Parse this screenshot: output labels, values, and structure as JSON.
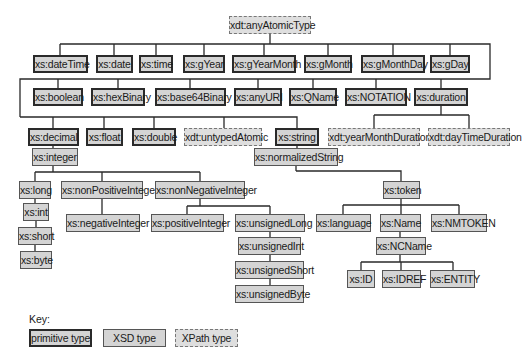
{
  "diagram": {
    "root": "xdt:anyAtomicType",
    "nodes": [
      {
        "id": "anyAtomicType",
        "label": "xdt:anyAtomicType",
        "kind": "xpath",
        "x": 229,
        "y": 16,
        "w": 82
      },
      {
        "id": "dateTime",
        "label": "xs:dateTime",
        "kind": "primitive",
        "x": 33,
        "y": 55,
        "w": 55
      },
      {
        "id": "date",
        "label": "xs:date",
        "kind": "primitive",
        "x": 96,
        "y": 55,
        "w": 37
      },
      {
        "id": "time",
        "label": "xs:time",
        "kind": "primitive",
        "x": 139,
        "y": 55,
        "w": 34
      },
      {
        "id": "gYear",
        "label": "xs:gYear",
        "kind": "primitive",
        "x": 183,
        "y": 55,
        "w": 42
      },
      {
        "id": "gYearMonth",
        "label": "xs:gYearMonth",
        "kind": "primitive",
        "x": 232,
        "y": 55,
        "w": 64
      },
      {
        "id": "gMonth",
        "label": "xs:gMonth",
        "kind": "primitive",
        "x": 304,
        "y": 55,
        "w": 48
      },
      {
        "id": "gMonthDay",
        "label": "xs:gMonthDay",
        "kind": "primitive",
        "x": 361,
        "y": 55,
        "w": 64
      },
      {
        "id": "gDay",
        "label": "xs:gDay",
        "kind": "primitive",
        "x": 430,
        "y": 55,
        "w": 40
      },
      {
        "id": "boolean",
        "label": "xs:boolean",
        "kind": "primitive",
        "x": 33,
        "y": 88,
        "w": 50
      },
      {
        "id": "hexBinary",
        "label": "xs:hexBinary",
        "kind": "primitive",
        "x": 91,
        "y": 88,
        "w": 54
      },
      {
        "id": "base64Binary",
        "label": "xs:base64Binary",
        "kind": "primitive",
        "x": 155,
        "y": 88,
        "w": 71
      },
      {
        "id": "anyURI",
        "label": "xs:anyURI",
        "kind": "primitive",
        "x": 234,
        "y": 88,
        "w": 48
      },
      {
        "id": "QName",
        "label": "xs:QName",
        "kind": "primitive",
        "x": 289,
        "y": 88,
        "w": 48
      },
      {
        "id": "NOTATION",
        "label": "xs:NOTATION",
        "kind": "primitive",
        "x": 345,
        "y": 88,
        "w": 62
      },
      {
        "id": "duration",
        "label": "xs:duration",
        "kind": "primitive",
        "x": 414,
        "y": 88,
        "w": 54
      },
      {
        "id": "decimal",
        "label": "xs:decimal",
        "kind": "primitive",
        "x": 28,
        "y": 128,
        "w": 51
      },
      {
        "id": "float",
        "label": "xs:float",
        "kind": "primitive",
        "x": 86,
        "y": 128,
        "w": 37
      },
      {
        "id": "double",
        "label": "xs:double",
        "kind": "primitive",
        "x": 132,
        "y": 128,
        "w": 44
      },
      {
        "id": "untypedAtomic",
        "label": "xdt:untypedAtomic",
        "kind": "xpath",
        "x": 184,
        "y": 128,
        "w": 78
      },
      {
        "id": "string",
        "label": "xs:string",
        "kind": "primitive",
        "x": 275,
        "y": 128,
        "w": 44
      },
      {
        "id": "yearMonthDuration",
        "label": "xdt:yearMonthDuration",
        "kind": "xpath",
        "x": 328,
        "y": 128,
        "w": 92
      },
      {
        "id": "dayTimeDuration",
        "label": "xdt:dayTimeDuration",
        "kind": "xpath",
        "x": 428,
        "y": 128,
        "w": 82
      },
      {
        "id": "integer",
        "label": "xs:integer",
        "kind": "xsd",
        "x": 32,
        "y": 148,
        "w": 46
      },
      {
        "id": "normalizedString",
        "label": "xs:normalizedString",
        "kind": "xsd",
        "x": 254,
        "y": 148,
        "w": 84
      },
      {
        "id": "long",
        "label": "xs:long",
        "kind": "xsd",
        "x": 19,
        "y": 181,
        "w": 32
      },
      {
        "id": "nonPositiveInteger",
        "label": "xs:nonPositiveInteger",
        "kind": "xsd",
        "x": 61,
        "y": 181,
        "w": 82
      },
      {
        "id": "nonNegativeInteger",
        "label": "xs:nonNegativeInteger",
        "kind": "xsd",
        "x": 155,
        "y": 181,
        "w": 90
      },
      {
        "id": "token",
        "label": "xs:token",
        "kind": "xsd",
        "x": 383,
        "y": 181,
        "w": 37
      },
      {
        "id": "int",
        "label": "xs:int",
        "kind": "xsd",
        "x": 23,
        "y": 203,
        "w": 26
      },
      {
        "id": "negativeInteger",
        "label": "xs:negativeInteger",
        "kind": "xsd",
        "x": 66,
        "y": 214,
        "w": 74
      },
      {
        "id": "positiveInteger",
        "label": "xs:positiveInteger",
        "kind": "xsd",
        "x": 151,
        "y": 214,
        "w": 73
      },
      {
        "id": "unsignedLong",
        "label": "xs:unsignedLong",
        "kind": "xsd",
        "x": 235,
        "y": 214,
        "w": 70
      },
      {
        "id": "language",
        "label": "xs:language",
        "kind": "xsd",
        "x": 316,
        "y": 214,
        "w": 55
      },
      {
        "id": "Name",
        "label": "xs:Name",
        "kind": "xsd",
        "x": 380,
        "y": 214,
        "w": 41
      },
      {
        "id": "NMTOKEN",
        "label": "xs:NMTOKEN",
        "kind": "xsd",
        "x": 431,
        "y": 214,
        "w": 56
      },
      {
        "id": "short",
        "label": "xs:short",
        "kind": "xsd",
        "x": 18,
        "y": 227,
        "w": 34
      },
      {
        "id": "unsignedInt",
        "label": "xs:unsignedInt",
        "kind": "xsd",
        "x": 238,
        "y": 237,
        "w": 63
      },
      {
        "id": "NCName",
        "label": "xs:NCName",
        "kind": "xsd",
        "x": 376,
        "y": 237,
        "w": 50
      },
      {
        "id": "byte",
        "label": "xs:byte",
        "kind": "xsd",
        "x": 20,
        "y": 251,
        "w": 32
      },
      {
        "id": "unsignedShort",
        "label": "xs:unsignedShort",
        "kind": "xsd",
        "x": 235,
        "y": 261,
        "w": 69
      },
      {
        "id": "ID",
        "label": "xs:ID",
        "kind": "xsd",
        "x": 347,
        "y": 270,
        "w": 28
      },
      {
        "id": "IDREF",
        "label": "xs:IDREF",
        "kind": "xsd",
        "x": 382,
        "y": 270,
        "w": 39
      },
      {
        "id": "ENTITY",
        "label": "xs:ENTITY",
        "kind": "xsd",
        "x": 430,
        "y": 270,
        "w": 45
      },
      {
        "id": "unsignedByte",
        "label": "xs:unsignedByte",
        "kind": "xsd",
        "x": 235,
        "y": 285,
        "w": 69
      }
    ],
    "edges": [
      [
        "anyAtomicType",
        "dateTime"
      ],
      [
        "anyAtomicType",
        "date"
      ],
      [
        "anyAtomicType",
        "time"
      ],
      [
        "anyAtomicType",
        "gYear"
      ],
      [
        "anyAtomicType",
        "gYearMonth"
      ],
      [
        "anyAtomicType",
        "gMonth"
      ],
      [
        "anyAtomicType",
        "gMonthDay"
      ],
      [
        "anyAtomicType",
        "gDay"
      ],
      [
        "anyAtomicType",
        "boolean"
      ],
      [
        "anyAtomicType",
        "hexBinary"
      ],
      [
        "anyAtomicType",
        "base64Binary"
      ],
      [
        "anyAtomicType",
        "anyURI"
      ],
      [
        "anyAtomicType",
        "QName"
      ],
      [
        "anyAtomicType",
        "NOTATION"
      ],
      [
        "anyAtomicType",
        "duration"
      ],
      [
        "anyAtomicType",
        "decimal"
      ],
      [
        "anyAtomicType",
        "float"
      ],
      [
        "anyAtomicType",
        "double"
      ],
      [
        "anyAtomicType",
        "untypedAtomic"
      ],
      [
        "anyAtomicType",
        "string"
      ],
      [
        "duration",
        "yearMonthDuration"
      ],
      [
        "duration",
        "dayTimeDuration"
      ],
      [
        "decimal",
        "integer"
      ],
      [
        "integer",
        "long"
      ],
      [
        "integer",
        "nonPositiveInteger"
      ],
      [
        "integer",
        "nonNegativeInteger"
      ],
      [
        "long",
        "int"
      ],
      [
        "int",
        "short"
      ],
      [
        "short",
        "byte"
      ],
      [
        "nonPositiveInteger",
        "negativeInteger"
      ],
      [
        "nonNegativeInteger",
        "positiveInteger"
      ],
      [
        "nonNegativeInteger",
        "unsignedLong"
      ],
      [
        "unsignedLong",
        "unsignedInt"
      ],
      [
        "unsignedInt",
        "unsignedShort"
      ],
      [
        "unsignedShort",
        "unsignedByte"
      ],
      [
        "string",
        "normalizedString"
      ],
      [
        "normalizedString",
        "token"
      ],
      [
        "token",
        "language"
      ],
      [
        "token",
        "Name"
      ],
      [
        "token",
        "NMTOKEN"
      ],
      [
        "Name",
        "NCName"
      ],
      [
        "NCName",
        "ID"
      ],
      [
        "NCName",
        "IDREF"
      ],
      [
        "NCName",
        "ENTITY"
      ]
    ]
  },
  "key": {
    "title": "Key:",
    "items": [
      {
        "label": "primitive type",
        "kind": "primitive",
        "x": 29,
        "y": 329,
        "w": 63
      },
      {
        "label": "XSD type",
        "kind": "xsd",
        "x": 103,
        "y": 329,
        "w": 63
      },
      {
        "label": "XPath type",
        "kind": "xpath",
        "x": 175,
        "y": 329,
        "w": 63
      }
    ]
  },
  "colors": {
    "node_fill": "#d4d4d4",
    "line": "#2a2a2a",
    "background": "#ffffff"
  }
}
